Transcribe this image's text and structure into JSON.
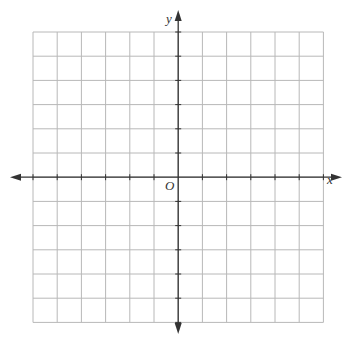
{
  "diagram": {
    "type": "coordinate-plane",
    "grid": {
      "columns": 12,
      "rows": 12,
      "left": 33,
      "top": 32,
      "cell": 24.2,
      "line_color": "#b8b8b8",
      "axis_color": "#333333"
    },
    "axes": {
      "x_label": "x",
      "y_label": "y",
      "origin_label": "O",
      "x_range": [
        -6,
        6
      ],
      "y_range": [
        -6,
        6
      ],
      "tick_marks": true,
      "arrows": "both-ends"
    }
  }
}
